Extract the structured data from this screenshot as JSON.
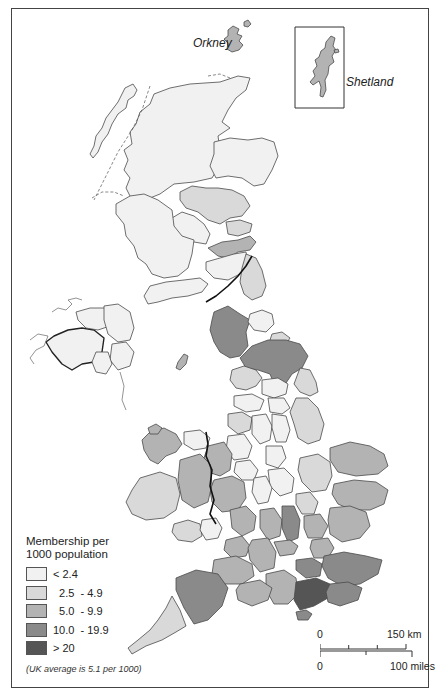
{
  "map": {
    "title": "Membership per 1000 population",
    "labels": {
      "orkney": "Orkney",
      "shetland": "Shetland"
    },
    "legend": {
      "title_line1": "Membership per",
      "title_line2": "1000 population",
      "classes": [
        {
          "label": "< 2.4",
          "color": "#f1f1f1"
        },
        {
          "label": "  2.5  - 4.9",
          "color": "#d9d9d9"
        },
        {
          "label": "  5.0  - 9.9",
          "color": "#b3b3b3"
        },
        {
          "label": "10.0  - 19.9",
          "color": "#8a8a8a"
        },
        {
          "label": "> 20",
          "color": "#555555"
        }
      ],
      "note": "(UK average is 5.1 per 1000)"
    },
    "scale": {
      "km_zero": "0",
      "km_label": "150 km",
      "mi_zero": "0",
      "mi_label": "100 miles"
    },
    "colors": {
      "c1": "#f1f1f1",
      "c2": "#d9d9d9",
      "c3": "#b3b3b3",
      "c4": "#8a8a8a",
      "c5": "#555555",
      "outline": "#4a4a4a"
    }
  }
}
